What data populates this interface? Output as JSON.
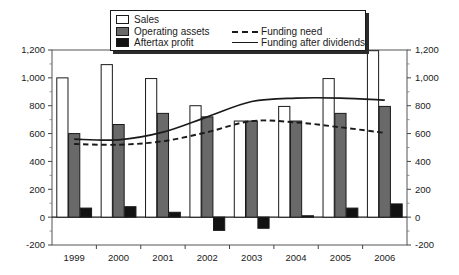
{
  "chart_data": {
    "type": "bar",
    "title": "",
    "xlabel": "",
    "ylabel": "",
    "categories": [
      "1999",
      "2000",
      "2001",
      "2002",
      "2003",
      "2004",
      "2005",
      "2006"
    ],
    "ylim": [
      -200,
      1200
    ],
    "yticks": [
      -200,
      0,
      200,
      400,
      600,
      800,
      1000,
      1200
    ],
    "ytick_labels": [
      "-200",
      "0",
      "200",
      "400",
      "600",
      "800",
      "1,000",
      "1,200"
    ],
    "dual_axis": true,
    "right_axis_same_as_left": true,
    "grid": false,
    "legend_position": "top-center",
    "series": [
      {
        "name": "Sales",
        "type": "bar",
        "color": "#ffffff",
        "values": [
          1000,
          1095,
          995,
          800,
          690,
          795,
          995,
          1195
        ]
      },
      {
        "name": "Operating assets",
        "type": "bar",
        "color": "#696969",
        "values": [
          600,
          665,
          745,
          720,
          690,
          690,
          745,
          795
        ]
      },
      {
        "name": "Aftertax profit",
        "type": "bar",
        "color": "#121212",
        "values": [
          65,
          75,
          35,
          -95,
          -80,
          10,
          65,
          95
        ]
      },
      {
        "name": "Funding need",
        "type": "line",
        "style": "dashed",
        "color": "#1a1a1a",
        "values": [
          525,
          520,
          545,
          610,
          690,
          680,
          645,
          605
        ]
      },
      {
        "name": "Funding after dividends",
        "type": "line",
        "style": "solid",
        "color": "#1a1a1a",
        "values": [
          560,
          555,
          610,
          720,
          830,
          855,
          855,
          840
        ]
      }
    ]
  },
  "legend": {
    "items": [
      {
        "label": "Sales",
        "marker": "swatch-white"
      },
      {
        "label": "Operating assets",
        "marker": "swatch-gray"
      },
      {
        "label": "Aftertax profit",
        "marker": "swatch-black"
      },
      {
        "label": "Funding need",
        "marker": "dashed-line"
      },
      {
        "label": "Funding after dividends",
        "marker": "solid-line"
      }
    ]
  },
  "axes": {
    "left_tick_labels": [
      "1,200",
      "1,000",
      "800",
      "600",
      "400",
      "200",
      "0",
      "-200"
    ],
    "right_tick_labels": [
      "1,200",
      "1,000",
      "800",
      "600",
      "400",
      "200",
      "0",
      "-200"
    ],
    "category_labels": [
      "1999",
      "2000",
      "2001",
      "2002",
      "2003",
      "2004",
      "2005",
      "2006"
    ]
  }
}
